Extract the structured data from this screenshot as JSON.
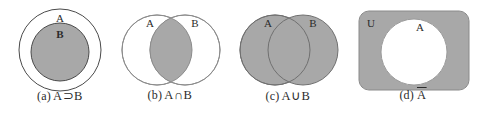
{
  "figure": {
    "background_color": "#ffffff",
    "fill_color": "#a8a8a8",
    "stroke_color": "#4a4a4a",
    "label_color": "#2b2b2b",
    "width": 477,
    "height": 114
  },
  "panels": [
    {
      "id": "a",
      "index_label": "(a)",
      "expression": "A⊃B",
      "caption": "(a) A⊃B",
      "relation": "subset",
      "set_labels": [
        "A",
        "B"
      ],
      "shaded_region": "B",
      "description": "Circle B drawn inside circle A; B is shaded",
      "geometry": {
        "outer_circle": {
          "cx": 60,
          "cy": 50,
          "r": 41,
          "label": "A",
          "filled": false
        },
        "inner_circle": {
          "cx": 60,
          "cy": 52,
          "r": 29,
          "label": "B",
          "filled": true
        }
      }
    },
    {
      "id": "b",
      "index_label": "(b)",
      "expression": "A∩B",
      "caption": "(b) A∩B",
      "relation": "intersection",
      "set_labels": [
        "A",
        "B"
      ],
      "shaded_region": "A∩B",
      "description": "Two overlapping circles; only the lens-shaped overlap is shaded",
      "geometry": {
        "left_circle": {
          "cx": 47,
          "cy": 50,
          "r": 35,
          "label": "A",
          "filled": false
        },
        "right_circle": {
          "cx": 75,
          "cy": 50,
          "r": 35,
          "label": "B",
          "filled": false
        }
      }
    },
    {
      "id": "c",
      "index_label": "(c)",
      "expression": "A∪B",
      "caption": "(c) A∪B",
      "relation": "union",
      "set_labels": [
        "A",
        "B"
      ],
      "shaded_region": "A∪B",
      "description": "Two overlapping circles; both circles entirely shaded",
      "geometry": {
        "left_circle": {
          "cx": 47,
          "cy": 50,
          "r": 35,
          "label": "A",
          "filled": true
        },
        "right_circle": {
          "cx": 75,
          "cy": 50,
          "r": 35,
          "label": "B",
          "filled": true
        }
      }
    },
    {
      "id": "d",
      "index_label": "(d)",
      "expression": "A̅",
      "caption": "(d) A̅",
      "relation": "complement",
      "set_labels": [
        "U",
        "A"
      ],
      "shaded_region": "U minus A",
      "description": "Shaded rounded rectangle U with an unshaded circle A inside",
      "geometry": {
        "universe_rect": {
          "x": 9,
          "y": 11,
          "width": 110,
          "height": 79,
          "rx": 10,
          "label": "U",
          "filled": true
        },
        "circle": {
          "cx": 64,
          "cy": 52,
          "r": 33,
          "label": "A",
          "filled": false
        }
      }
    }
  ]
}
